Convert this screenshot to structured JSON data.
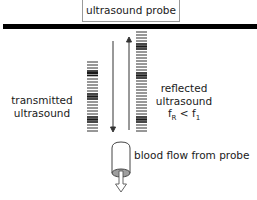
{
  "diagram": {
    "probe_label": "ultrasound probe",
    "transmitted_label": [
      "transmitted",
      "ultrasound"
    ],
    "reflected_label": [
      "reflected",
      "ultrasound"
    ],
    "frequency_relation": {
      "lhs": "f",
      "lhs_sub": "R",
      "op": "<",
      "rhs": "f",
      "rhs_sub": "1"
    },
    "blood_flow_label": "blood flow from probe",
    "colors": {
      "line": "#000000",
      "bars": "#1a1a1a",
      "cylinder_end": "#9e9e9e",
      "probe_border": "#9a9a9a"
    }
  }
}
